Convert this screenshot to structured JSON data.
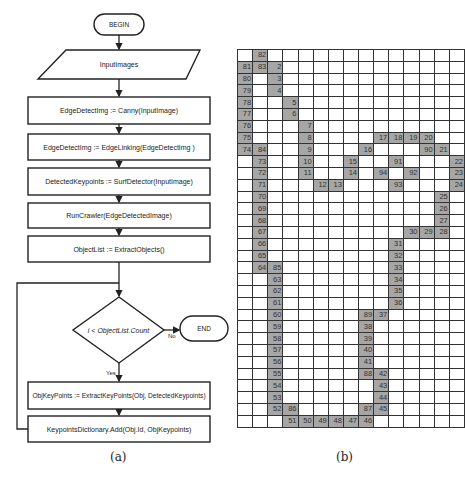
{
  "flowchart": {
    "caption": "(a)",
    "begin": "BEGIN",
    "input": "InputImages",
    "steps": [
      "EdgeDetectImg := Canny(InputImage)",
      "EdgeDetectImg := EdgeLinking(EdgeDetectImg )",
      "DetectedKeypoints := SurfDetector(InputImage)",
      "RunCrawler(EdgeDetectedImage)",
      "ObjectList := ExtractObjects()"
    ],
    "decision": "i < ObjectList.Count",
    "end": "END",
    "no_label": "No",
    "yes_label": "Yes",
    "loop_steps": [
      "ObjKeyPoints := ExtractKeyPoints(Obj, DetectedKeypoints)",
      "KeypointsDictionary.Add(Obj.Id, ObjKeypoints)"
    ]
  },
  "grid": {
    "caption": "(b)",
    "columns": 15,
    "rows": 32,
    "fill_color": "#a6a6a6",
    "cells": [
      {
        "r": 0,
        "c": 1,
        "v": "82"
      },
      {
        "r": 1,
        "c": 0,
        "v": "81"
      },
      {
        "r": 1,
        "c": 1,
        "v": "83"
      },
      {
        "r": 1,
        "c": 2,
        "v": "2"
      },
      {
        "r": 2,
        "c": 0,
        "v": "80"
      },
      {
        "r": 2,
        "c": 2,
        "v": "3"
      },
      {
        "r": 3,
        "c": 0,
        "v": "79"
      },
      {
        "r": 3,
        "c": 2,
        "v": "4"
      },
      {
        "r": 4,
        "c": 0,
        "v": "78"
      },
      {
        "r": 4,
        "c": 3,
        "v": "5"
      },
      {
        "r": 5,
        "c": 0,
        "v": "77"
      },
      {
        "r": 5,
        "c": 3,
        "v": "6"
      },
      {
        "r": 6,
        "c": 0,
        "v": "76"
      },
      {
        "r": 6,
        "c": 4,
        "v": "7"
      },
      {
        "r": 7,
        "c": 0,
        "v": "75"
      },
      {
        "r": 7,
        "c": 4,
        "v": "8"
      },
      {
        "r": 7,
        "c": 9,
        "v": "17"
      },
      {
        "r": 7,
        "c": 10,
        "v": "18"
      },
      {
        "r": 7,
        "c": 11,
        "v": "19"
      },
      {
        "r": 7,
        "c": 12,
        "v": "20"
      },
      {
        "r": 8,
        "c": 0,
        "v": "74"
      },
      {
        "r": 8,
        "c": 1,
        "v": "84"
      },
      {
        "r": 8,
        "c": 4,
        "v": "9"
      },
      {
        "r": 8,
        "c": 8,
        "v": "16"
      },
      {
        "r": 8,
        "c": 12,
        "v": "90"
      },
      {
        "r": 8,
        "c": 13,
        "v": "21"
      },
      {
        "r": 9,
        "c": 1,
        "v": "73"
      },
      {
        "r": 9,
        "c": 4,
        "v": "10"
      },
      {
        "r": 9,
        "c": 7,
        "v": "15"
      },
      {
        "r": 9,
        "c": 10,
        "v": "91"
      },
      {
        "r": 9,
        "c": 14,
        "v": "22"
      },
      {
        "r": 10,
        "c": 1,
        "v": "72"
      },
      {
        "r": 10,
        "c": 4,
        "v": "11"
      },
      {
        "r": 10,
        "c": 7,
        "v": "14"
      },
      {
        "r": 10,
        "c": 9,
        "v": "94"
      },
      {
        "r": 10,
        "c": 11,
        "v": "92"
      },
      {
        "r": 10,
        "c": 14,
        "v": "23"
      },
      {
        "r": 11,
        "c": 1,
        "v": "71"
      },
      {
        "r": 11,
        "c": 5,
        "v": "12"
      },
      {
        "r": 11,
        "c": 6,
        "v": "13"
      },
      {
        "r": 11,
        "c": 10,
        "v": "93"
      },
      {
        "r": 11,
        "c": 14,
        "v": "24"
      },
      {
        "r": 12,
        "c": 1,
        "v": "70"
      },
      {
        "r": 12,
        "c": 13,
        "v": "25"
      },
      {
        "r": 13,
        "c": 1,
        "v": "69"
      },
      {
        "r": 13,
        "c": 13,
        "v": "26"
      },
      {
        "r": 14,
        "c": 1,
        "v": "68"
      },
      {
        "r": 14,
        "c": 13,
        "v": "27"
      },
      {
        "r": 15,
        "c": 1,
        "v": "67"
      },
      {
        "r": 15,
        "c": 11,
        "v": "30"
      },
      {
        "r": 15,
        "c": 12,
        "v": "29"
      },
      {
        "r": 15,
        "c": 13,
        "v": "28"
      },
      {
        "r": 16,
        "c": 1,
        "v": "66"
      },
      {
        "r": 16,
        "c": 10,
        "v": "31"
      },
      {
        "r": 17,
        "c": 1,
        "v": "65"
      },
      {
        "r": 17,
        "c": 10,
        "v": "32"
      },
      {
        "r": 18,
        "c": 1,
        "v": "64"
      },
      {
        "r": 18,
        "c": 2,
        "v": "85"
      },
      {
        "r": 18,
        "c": 10,
        "v": "33"
      },
      {
        "r": 19,
        "c": 2,
        "v": "63"
      },
      {
        "r": 19,
        "c": 10,
        "v": "34"
      },
      {
        "r": 20,
        "c": 2,
        "v": "62"
      },
      {
        "r": 20,
        "c": 10,
        "v": "35"
      },
      {
        "r": 21,
        "c": 2,
        "v": "61"
      },
      {
        "r": 21,
        "c": 10,
        "v": "36"
      },
      {
        "r": 22,
        "c": 2,
        "v": "60"
      },
      {
        "r": 22,
        "c": 8,
        "v": "89"
      },
      {
        "r": 22,
        "c": 9,
        "v": "37"
      },
      {
        "r": 23,
        "c": 2,
        "v": "59"
      },
      {
        "r": 23,
        "c": 8,
        "v": "38"
      },
      {
        "r": 24,
        "c": 2,
        "v": "58"
      },
      {
        "r": 24,
        "c": 8,
        "v": "39"
      },
      {
        "r": 25,
        "c": 2,
        "v": "57"
      },
      {
        "r": 25,
        "c": 8,
        "v": "40"
      },
      {
        "r": 26,
        "c": 2,
        "v": "56"
      },
      {
        "r": 26,
        "c": 8,
        "v": "41"
      },
      {
        "r": 27,
        "c": 2,
        "v": "55"
      },
      {
        "r": 27,
        "c": 8,
        "v": "88"
      },
      {
        "r": 27,
        "c": 9,
        "v": "42"
      },
      {
        "r": 28,
        "c": 2,
        "v": "54"
      },
      {
        "r": 28,
        "c": 9,
        "v": "43"
      },
      {
        "r": 29,
        "c": 2,
        "v": "53"
      },
      {
        "r": 29,
        "c": 9,
        "v": "44"
      },
      {
        "r": 30,
        "c": 2,
        "v": "52"
      },
      {
        "r": 30,
        "c": 3,
        "v": "86"
      },
      {
        "r": 30,
        "c": 8,
        "v": "87"
      },
      {
        "r": 30,
        "c": 9,
        "v": "45"
      },
      {
        "r": 31,
        "c": 3,
        "v": "51"
      },
      {
        "r": 31,
        "c": 4,
        "v": "50"
      },
      {
        "r": 31,
        "c": 5,
        "v": "49"
      },
      {
        "r": 31,
        "c": 6,
        "v": "48"
      },
      {
        "r": 31,
        "c": 7,
        "v": "47"
      },
      {
        "r": 31,
        "c": 8,
        "v": "46"
      }
    ]
  }
}
